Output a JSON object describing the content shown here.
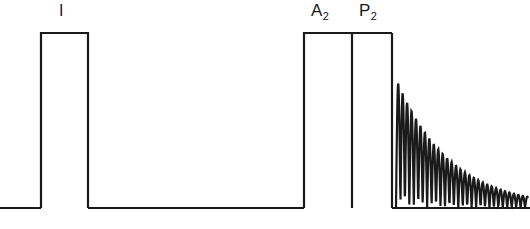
{
  "figure": {
    "type": "phonocardiogram-waveform",
    "background_color": "#ffffff",
    "stroke_color": "#1a1a1a",
    "stroke_width": 2.2,
    "width": 530,
    "height": 229
  },
  "labels": {
    "first_sound": {
      "text": "I",
      "x": 65,
      "y": 12
    },
    "aortic": {
      "base": "A",
      "sub": "2",
      "x": 322,
      "y": 12
    },
    "pulmonic": {
      "base": "P",
      "sub": "2",
      "x": 370,
      "y": 12
    }
  },
  "chart_data": {
    "type": "line",
    "title": "",
    "xlabel": "",
    "ylabel": "",
    "xlim": [
      0,
      530
    ],
    "ylim": [
      229,
      0
    ],
    "grid": false,
    "legend": "none",
    "baseline_y": 208,
    "plateau_y": 33,
    "annotations": [
      {
        "label": "I",
        "x": 65
      },
      {
        "label": "A2",
        "x": 322
      },
      {
        "label": "P2",
        "x": 370
      }
    ],
    "segments": [
      {
        "name": "baseline-start",
        "kind": "polyline",
        "points": [
          [
            0,
            208
          ],
          [
            41,
            208
          ]
        ]
      },
      {
        "name": "first-sound-pulse",
        "kind": "polyline",
        "points": [
          [
            41,
            208
          ],
          [
            41,
            33
          ],
          [
            88,
            33
          ],
          [
            88,
            208
          ]
        ]
      },
      {
        "name": "baseline-systole",
        "kind": "polyline",
        "points": [
          [
            88,
            208
          ],
          [
            304,
            208
          ]
        ]
      },
      {
        "name": "aortic-pulse-rise",
        "kind": "polyline",
        "points": [
          [
            304,
            208
          ],
          [
            304,
            33
          ],
          [
            392,
            33
          ]
        ]
      },
      {
        "name": "a2-p2-divider",
        "kind": "polyline",
        "points": [
          [
            352,
            33
          ],
          [
            352,
            208
          ]
        ]
      },
      {
        "name": "pulmonic-pulse-fall",
        "kind": "polyline",
        "points": [
          [
            392,
            33
          ],
          [
            392,
            208
          ]
        ]
      },
      {
        "name": "baseline-diastole",
        "kind": "polyline",
        "points": [
          [
            392,
            208
          ],
          [
            530,
            208
          ]
        ]
      },
      {
        "name": "decrescendo-murmur",
        "kind": "damped-oscillation",
        "x_start": 396,
        "x_end": 528,
        "baseline": 208,
        "amplitude_start": 130,
        "amplitude_end": 11,
        "decay": "exponential",
        "period_px": 4.45,
        "cycles": 30
      }
    ]
  }
}
